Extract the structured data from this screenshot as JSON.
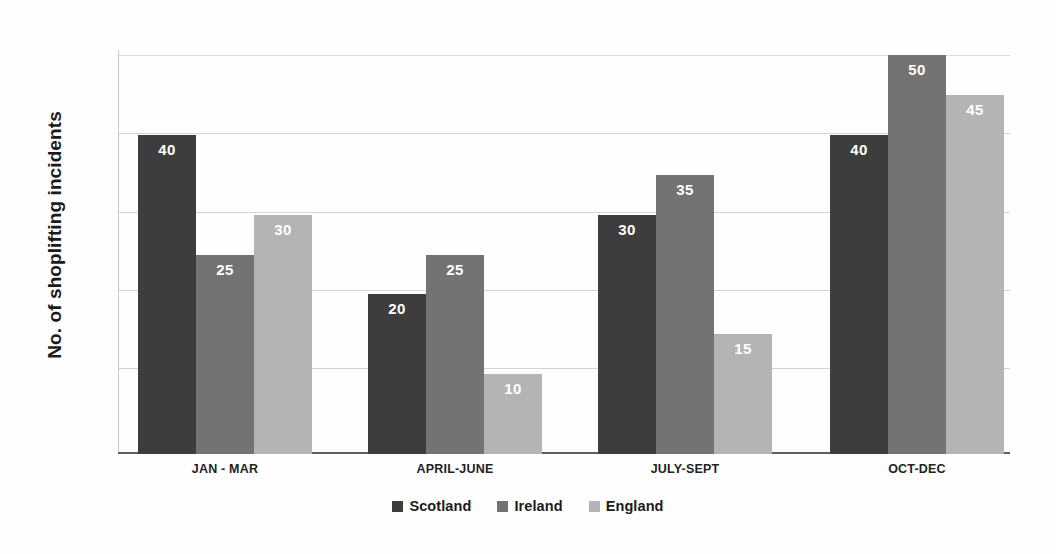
{
  "chart_data": {
    "type": "bar",
    "title": "",
    "xlabel": "",
    "ylabel": "No. of shoplifting incidents",
    "categories": [
      "JAN - MAR",
      "APRIL-JUNE",
      "JULY-SEPT",
      "OCT-DEC"
    ],
    "series": [
      {
        "name": "Scotland",
        "color": "#3d3d3d",
        "values": [
          40,
          20,
          30,
          40
        ]
      },
      {
        "name": "Ireland",
        "color": "#737373",
        "values": [
          25,
          25,
          35,
          50
        ]
      },
      {
        "name": "England",
        "color": "#b4b4b4",
        "values": [
          30,
          10,
          15,
          45
        ]
      }
    ],
    "ylim": [
      0,
      50
    ],
    "y_gridlines": [
      10,
      20,
      30,
      40,
      50
    ],
    "y_tick_labels": [],
    "grid": true,
    "data_labels": true,
    "legend_position": "bottom"
  }
}
